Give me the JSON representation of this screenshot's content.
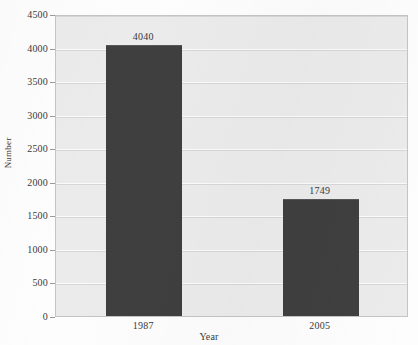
{
  "chart_data": {
    "type": "bar",
    "title": "",
    "xlabel": "Year",
    "ylabel": "Number",
    "categories": [
      "1987",
      "2005"
    ],
    "values": [
      4040,
      1749
    ],
    "value_labels": [
      "4040",
      "1749"
    ],
    "ylim": [
      0,
      4500
    ],
    "yticks": [
      0,
      500,
      1000,
      1500,
      2000,
      2500,
      3000,
      3500,
      4000,
      4500
    ],
    "ytick_labels": [
      "0",
      "500",
      "1000",
      "1500",
      "2000",
      "2500",
      "3000",
      "3500",
      "4000",
      "4500"
    ],
    "grid": true,
    "legend": false,
    "series": [
      {
        "name": "Number",
        "values": [
          4040,
          1749
        ],
        "color": "#3f3f3f"
      }
    ],
    "colors": {
      "bar": "#3f3f3f",
      "plot_background": "#ebebeb",
      "gridline": "#d6d6d6",
      "axis_border": "#c4c4c4",
      "text": "#3a3a3a",
      "page_background": "#fdfdfd"
    }
  }
}
